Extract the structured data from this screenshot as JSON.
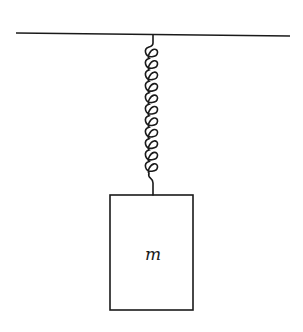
{
  "diagram": {
    "ceiling": {
      "label": "",
      "x1": 16,
      "y1": 33,
      "x2": 290,
      "y2": 36
    },
    "spring": {
      "attach_x": 153,
      "top_y": 35,
      "coil_start_y": 46,
      "coil_end_y": 172,
      "bottom_y": 195,
      "coils": 11
    },
    "mass": {
      "label": "m",
      "x": 110,
      "y": 195,
      "width": 83,
      "height": 115
    },
    "colors": {
      "stroke": "#1a1a1a",
      "background": "#ffffff"
    }
  }
}
